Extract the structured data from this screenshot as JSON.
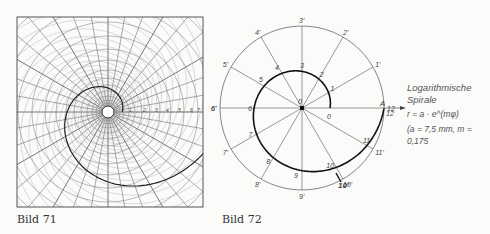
{
  "figure_left": {
    "caption": "Bild 71",
    "scale_labels": [
      "1",
      "2",
      "3",
      "4",
      "5",
      "6",
      "7"
    ]
  },
  "figure_right": {
    "caption": "Bild 72",
    "inner_labels": [
      "0",
      "1",
      "2",
      "3",
      "4",
      "5",
      "6",
      "7",
      "8",
      "9",
      "10",
      "11",
      "12"
    ],
    "outer_labels": [
      "1'",
      "2'",
      "3'",
      "4'",
      "5'",
      "6'",
      "7'",
      "8'",
      "9'",
      "10'",
      "11'",
      "12"
    ],
    "center_label": "0",
    "point_label": "A",
    "bold_label": "10'",
    "note": {
      "title_line1": "Logarithmische",
      "title_line2": "Spirale",
      "formula": "r = a · e^(mφ)",
      "params": "(a = 7,5 mm, m = 0,175"
    }
  }
}
